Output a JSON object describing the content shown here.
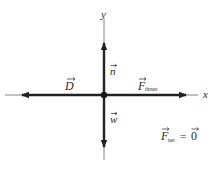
{
  "diagram": {
    "axes": {
      "x_label": "x",
      "y_label": "y"
    },
    "forces": [
      {
        "id": "normal",
        "symbol": "n",
        "subscript": "",
        "direction": "up"
      },
      {
        "id": "weight",
        "symbol": "w",
        "subscript": "",
        "direction": "down"
      },
      {
        "id": "drag",
        "symbol": "D",
        "subscript": "",
        "direction": "left"
      },
      {
        "id": "thrust",
        "symbol": "F",
        "subscript": "thrust",
        "direction": "right"
      }
    ],
    "net_force": {
      "symbol": "F",
      "subscript": "net",
      "equals": "=",
      "value": "0"
    },
    "colors": {
      "axis": "#555555",
      "vector": "#222222",
      "text": "#2a2a2a",
      "background": "#ffffff"
    }
  }
}
